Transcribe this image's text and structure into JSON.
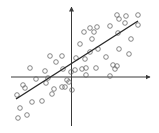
{
  "chart_data": {
    "type": "scatter",
    "title": "",
    "xlabel": "",
    "ylabel": "",
    "grid": false,
    "legend": null,
    "axes": {
      "origin_px": [
        71.5,
        77
      ],
      "x_axis_px": [
        11,
        150
      ],
      "y_axis_px": [
        7,
        126
      ],
      "arrows": true,
      "color": "#3a3a3a"
    },
    "marker": {
      "shape": "hollow-circle",
      "radius": 2.3,
      "color": "#6a6a6a"
    },
    "regression_line": {
      "x1": 16,
      "y1": 99,
      "x2": 138,
      "y2": 21,
      "color": "#2a2a2a"
    },
    "points": [
      [
        117,
        15
      ],
      [
        126,
        16
      ],
      [
        138,
        15
      ],
      [
        119,
        19
      ],
      [
        125,
        23
      ],
      [
        138,
        25
      ],
      [
        110,
        26
      ],
      [
        90,
        28
      ],
      [
        97,
        27
      ],
      [
        94,
        32
      ],
      [
        84,
        32
      ],
      [
        118,
        33
      ],
      [
        92,
        39
      ],
      [
        131,
        39
      ],
      [
        80,
        44
      ],
      [
        98,
        49
      ],
      [
        119,
        49
      ],
      [
        90,
        52
      ],
      [
        129,
        54
      ],
      [
        76,
        58
      ],
      [
        85,
        59
      ],
      [
        106,
        57
      ],
      [
        50,
        56
      ],
      [
        62,
        56
      ],
      [
        56,
        62
      ],
      [
        113,
        65
      ],
      [
        117,
        66
      ],
      [
        115,
        69
      ],
      [
        96,
        68
      ],
      [
        82,
        69
      ],
      [
        86,
        68
      ],
      [
        75,
        70
      ],
      [
        71,
        72
      ],
      [
        63,
        69
      ],
      [
        30,
        68
      ],
      [
        45,
        71
      ],
      [
        86,
        75
      ],
      [
        110,
        76
      ],
      [
        67,
        80
      ],
      [
        69,
        82
      ],
      [
        48,
        78
      ],
      [
        36,
        79
      ],
      [
        46,
        83
      ],
      [
        23,
        85
      ],
      [
        25,
        88
      ],
      [
        62,
        87
      ],
      [
        65,
        87
      ],
      [
        54,
        89
      ],
      [
        72,
        90
      ],
      [
        17,
        95
      ],
      [
        52,
        94
      ],
      [
        42,
        101
      ],
      [
        32,
        102
      ],
      [
        20,
        108
      ],
      [
        27,
        115
      ],
      [
        18,
        118
      ]
    ]
  }
}
